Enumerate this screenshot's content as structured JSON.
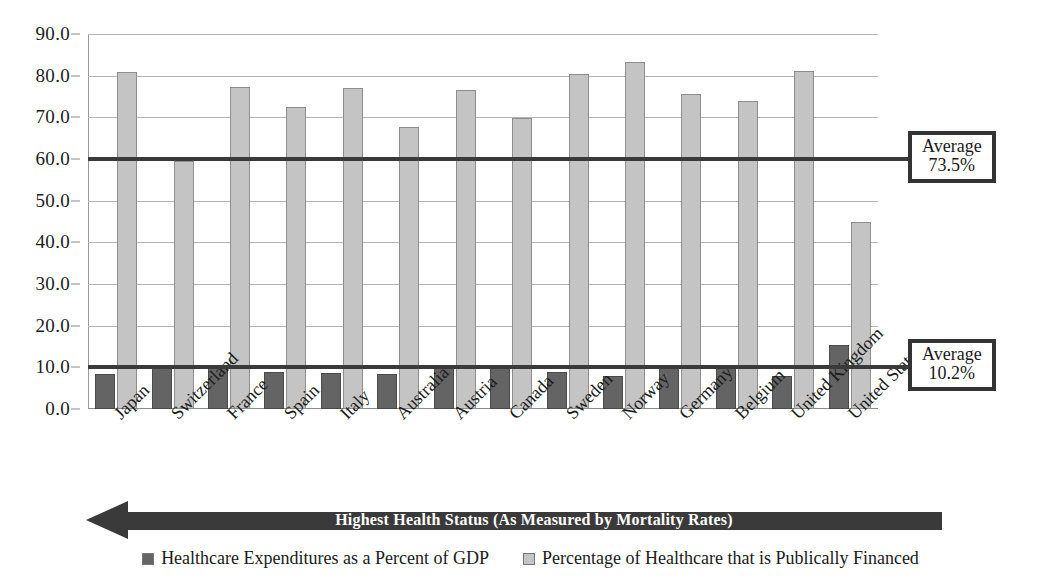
{
  "chart_data": {
    "type": "bar",
    "title": "",
    "subtitle": "",
    "xlabel": "",
    "ylabel": "",
    "ylim": [
      0,
      90
    ],
    "ytick_step": 10,
    "grid": true,
    "legend_position": "bottom",
    "categories": [
      "Japan",
      "Switzerland",
      "France",
      "Spain",
      "Italy",
      "Australia",
      "Austria",
      "Canada",
      "Sweden",
      "Norway",
      "Germany",
      "Belgium",
      "United Kingdom",
      "United States"
    ],
    "ytick_labels": [
      "0.0",
      "10.0",
      "20.0",
      "30.0",
      "40.0",
      "50.0",
      "60.0",
      "70.0",
      "80.0",
      "90.0"
    ],
    "ytick_values": [
      0,
      10,
      20,
      30,
      40,
      50,
      60,
      70,
      80,
      90
    ],
    "series": [
      {
        "name": "Healthcare Expenditures as a Percent of GDP",
        "color": "#646464",
        "values": [
          8.5,
          10.5,
          10.5,
          8.8,
          8.7,
          8.5,
          9.8,
          9.8,
          8.9,
          8.0,
          10.4,
          9.8,
          8.0,
          15.3
        ]
      },
      {
        "name": "Percentage of Healthcare that is Publically Financed",
        "color": "#c4c4c4",
        "values": [
          80.8,
          59.5,
          77.4,
          72.4,
          77.0,
          67.7,
          76.5,
          69.8,
          80.5,
          83.2,
          75.5,
          73.9,
          81.2,
          44.8
        ]
      }
    ],
    "reference_lines": [
      {
        "name": "public-financing-average",
        "value": 60.0,
        "label_title": "Average",
        "label_value": "73.5%"
      },
      {
        "name": "expenditure-average",
        "value": 10.2,
        "label_title": "Average",
        "label_value": "10.2%"
      }
    ],
    "annotations": [
      {
        "name": "direction-arrow-banner",
        "text": "Highest Health Status (As Measured by Mortality Rates)",
        "direction": "left",
        "color": "#3a3a3a"
      }
    ]
  },
  "legend": {
    "items": [
      {
        "label": "Healthcare Expenditures as a Percent of GDP",
        "swatch_color": "#646464",
        "icon": "square-swatch-icon"
      },
      {
        "label": "Percentage of Healthcare that is Publically Financed",
        "swatch_color": "#c4c4c4",
        "icon": "square-swatch-icon"
      }
    ]
  }
}
